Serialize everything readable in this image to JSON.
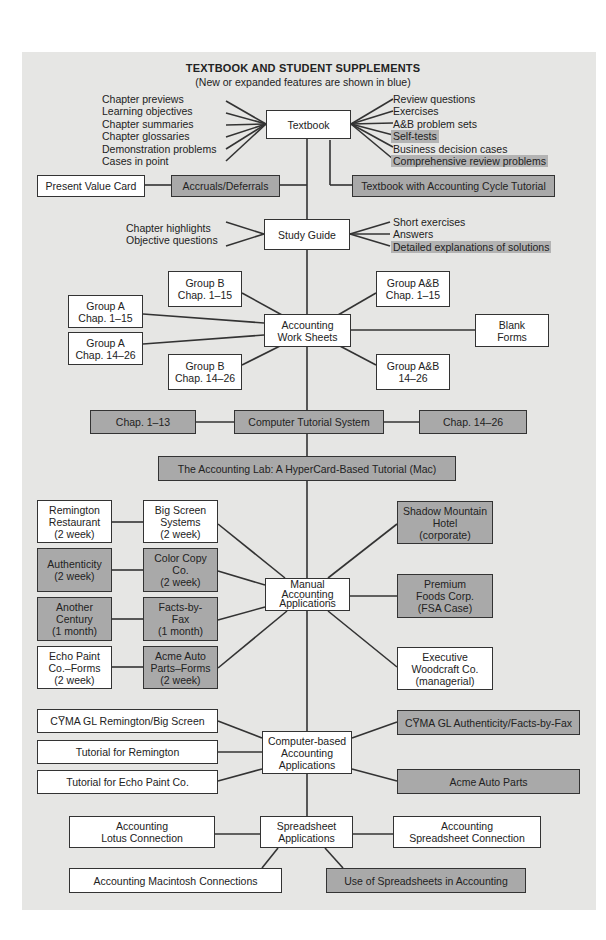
{
  "header": {
    "title": "TEXTBOOK AND STUDENT SUPPLEMENTS",
    "subtitle": "(New or expanded features are shown in blue)"
  },
  "legend": {
    "new_feature_color": "#a9a9a9",
    "standard_color": "#ffffff"
  },
  "textbook": {
    "label": "Textbook",
    "left_features": [
      "Chapter previews",
      "Learning objectives",
      "Chapter summaries",
      "Chapter glossaries",
      "Demonstration problems",
      "Cases in point"
    ],
    "right_features": [
      {
        "label": "Review questions",
        "new": false
      },
      {
        "label": "Exercises",
        "new": false
      },
      {
        "label": "A&B problem sets",
        "new": false
      },
      {
        "label": "Self-tests",
        "new": true
      },
      {
        "label": "Business decision cases",
        "new": false
      },
      {
        "label": "Comprehensive review problems",
        "new": true
      }
    ],
    "present_value_card": "Present Value Card",
    "accruals_deferrals": "Accruals/Deferrals",
    "cycle_tutorial": "Textbook with Accounting Cycle Tutorial"
  },
  "study_guide": {
    "label": "Study Guide",
    "left_features": [
      "Chapter highlights",
      "Objective questions"
    ],
    "right_features": [
      {
        "label": "Short exercises",
        "new": false
      },
      {
        "label": "Answers",
        "new": false
      },
      {
        "label": "Detailed explanations of solutions",
        "new": true
      }
    ]
  },
  "work_sheets": {
    "label": "Accounting\nWork Sheets",
    "group_b_1_15": "Group B\nChap. 1–15",
    "group_a_1_15": "Group A\nChap. 1–15",
    "group_a_14_26": "Group A\nChap. 14–26",
    "group_b_14_26": "Group B\nChap. 14–26",
    "group_ab_1_15": "Group A&B\nChap. 1–15",
    "group_ab_14_26": "Group A&B\n14–26",
    "blank_forms": "Blank\nForms"
  },
  "tutorial_system": {
    "label": "Computer Tutorial System",
    "chap_1_13": "Chap. 1–13",
    "chap_14_26": "Chap. 14–26",
    "accounting_lab": "The Accounting Lab: A HyperCard-Based Tutorial (Mac)"
  },
  "manual_apps": {
    "label": "Manual\nAccounting\nApplications",
    "remington": "Remington\nRestaurant\n(2 week)",
    "big_screen": "Big Screen\nSystems\n(2 week)",
    "authenticity": "Authenticity\n(2 week)",
    "color_copy": "Color Copy\nCo.\n(2 week)",
    "another_century": "Another\nCentury\n(1 month)",
    "facts_by_fax": "Facts-by-\nFax\n(1 month)",
    "echo_paint": "Echo Paint\nCo.–Forms\n(2 week)",
    "acme_forms": "Acme Auto\nParts–Forms\n(2 week)",
    "shadow_mountain": "Shadow Mountain\nHotel\n(corporate)",
    "premium_foods": "Premium\nFoods Corp.\n(FSA Case)",
    "executive_woodcraft": "Executive\nWoodcraft Co.\n(managerial)"
  },
  "computer_apps": {
    "label": "Computer-based\nAccounting\nApplications",
    "cyma_remington": "CY̅MA GL Remington/Big Screen",
    "tutorial_remington": "Tutorial for Remington",
    "tutorial_echo": "Tutorial for Echo Paint Co.",
    "cyma_authenticity": "CY̅MA GL Authenticity/Facts-by-Fax",
    "acme_auto_parts": "Acme Auto Parts"
  },
  "spreadsheet_apps": {
    "label": "Spreadsheet\nApplications",
    "lotus": "Accounting\nLotus Connection",
    "spreadsheet_connection": "Accounting\nSpreadsheet Connection",
    "macintosh": "Accounting Macintosh Connections",
    "use_of_spreadsheets": "Use of Spreadsheets in Accounting"
  }
}
